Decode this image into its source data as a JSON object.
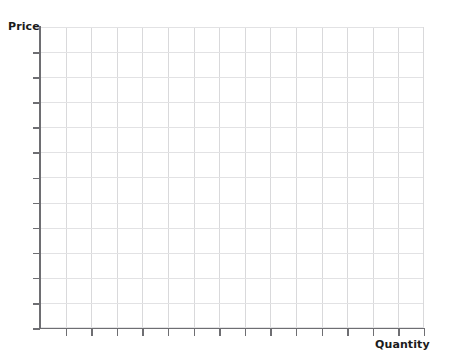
{
  "chart_data": {
    "type": "line",
    "title": "",
    "subtitle": "",
    "xlabel": "Quantity",
    "ylabel": "Price",
    "series": [],
    "categories": [],
    "values": [],
    "x_tick_labels": [],
    "y_tick_labels": [],
    "grid": true,
    "legend": false,
    "legend_position": "none",
    "annotations": [],
    "x_major_ticks": 15,
    "y_major_ticks": 12
  },
  "plot": {
    "x_axis_label": "Quantity",
    "y_axis_label": "Price",
    "grid_columns": 15,
    "grid_rows": 12,
    "x_tick_count": 15,
    "y_tick_count": 12
  },
  "colors": {
    "background": "#ffffff",
    "axis": "#6e6e72",
    "grid_vertical": "#d9d9db",
    "grid_horizontal": "#e2e2e4",
    "label_text": "#1b1b1b"
  }
}
